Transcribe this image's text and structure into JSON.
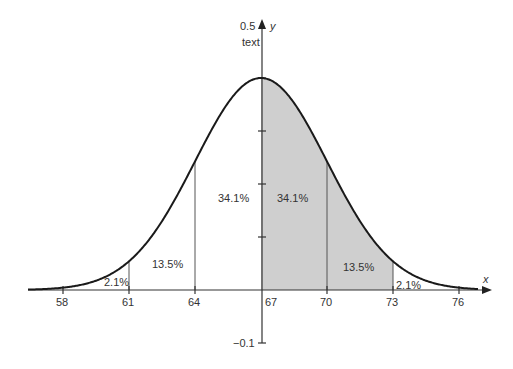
{
  "chart_data": {
    "type": "area",
    "title": "",
    "xlabel": "x",
    "ylabel": "y",
    "y_annotation": "text",
    "distribution": "normal",
    "mean": 67,
    "std_dev": 3,
    "peak_y": 0.4,
    "xlim": [
      56.5,
      77.5
    ],
    "ylim": [
      -0.1,
      0.5
    ],
    "x_ticks": [
      58,
      61,
      64,
      67,
      70,
      73,
      76
    ],
    "y_ticks": [
      -0.1,
      0,
      0.1,
      0.2,
      0.3,
      0.4,
      0.5
    ],
    "y_tick_labels_shown": [
      "0.5",
      "-0.1"
    ],
    "shaded_region": {
      "from": 67,
      "to": 73,
      "color": "#cfcfcf"
    },
    "vertical_lines_at": [
      61,
      64,
      70,
      73
    ],
    "region_labels": [
      {
        "label": "2.1%",
        "x_from": 58,
        "x_to": 61
      },
      {
        "label": "13.5%",
        "x_from": 61,
        "x_to": 64
      },
      {
        "label": "34.1%",
        "x_from": 64,
        "x_to": 67
      },
      {
        "label": "34.1%",
        "x_from": 67,
        "x_to": 70
      },
      {
        "label": "13.5%",
        "x_from": 70,
        "x_to": 73
      },
      {
        "label": "2.1%",
        "x_from": 73,
        "x_to": 76
      }
    ],
    "grid": false,
    "legend": null
  },
  "labels": {
    "y_top": "0.5",
    "y_axis_name": "y",
    "y_text": "text",
    "y_bottom": "−0.1",
    "x_axis_name": "x",
    "x_ticks": [
      "58",
      "61",
      "64",
      "67",
      "70",
      "73",
      "76"
    ],
    "pct": [
      "2.1%",
      "13.5%",
      "34.1%",
      "34.1%",
      "13.5%",
      "2.1%"
    ]
  }
}
